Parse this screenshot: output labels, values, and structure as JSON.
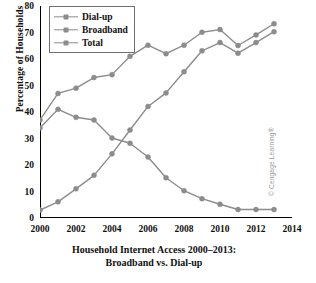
{
  "chart_data": {
    "type": "line",
    "title": "Household Internet Access 2000–2013:\nBroadband vs. Dial-up",
    "title_line1": "Household Internet Access 2000–2013:",
    "title_line2": "Broadband vs. Dial-up",
    "xlabel": "",
    "ylabel": "Percentage of Households",
    "x": [
      2000,
      2001,
      2002,
      2003,
      2004,
      2005,
      2006,
      2007,
      2008,
      2009,
      2010,
      2011,
      2012,
      2013
    ],
    "categories": [
      "2000",
      "2001",
      "2002",
      "2003",
      "2004",
      "2005",
      "2006",
      "2007",
      "2008",
      "2009",
      "2010",
      "2011",
      "2012",
      "2013"
    ],
    "xlim": [
      2000,
      2014
    ],
    "ylim": [
      0,
      80
    ],
    "xticks": [
      2000,
      2002,
      2004,
      2006,
      2008,
      2010,
      2012,
      2014
    ],
    "xtick_labels": [
      "2000",
      "2002",
      "2004",
      "2006",
      "2008",
      "2010",
      "2012",
      "2014"
    ],
    "yticks": [
      0,
      10,
      20,
      30,
      40,
      50,
      60,
      70,
      80
    ],
    "ytick_labels": [
      "0",
      "10",
      "20",
      "30",
      "40",
      "50",
      "60",
      "70",
      "80"
    ],
    "grid": false,
    "legend_position": "upper left",
    "marker": "circle",
    "series": [
      {
        "name": "Dial-up",
        "color": "#8c8c8c",
        "values": [
          34.0,
          41.0,
          38.0,
          37.0,
          30.2,
          28.2,
          23.0,
          15.2,
          10.3,
          7.3,
          5.2,
          3.2,
          3.2,
          3.2
        ]
      },
      {
        "name": "Broadband",
        "color": "#8c8c8c",
        "values": [
          3.0,
          6.1,
          11.0,
          16.1,
          24.2,
          33.2,
          42.1,
          47.2,
          55.2,
          63.1,
          66.2,
          62.2,
          66.2,
          70.3
        ]
      },
      {
        "name": "Total",
        "color": "#8c8c8c",
        "values": [
          37.0,
          47.0,
          49.0,
          53.0,
          54.1,
          61.0,
          65.2,
          62.0,
          65.2,
          70.1,
          71.1,
          65.1,
          69.1,
          73.3
        ]
      }
    ]
  },
  "legend": {
    "items": [
      {
        "label": "Dial-up"
      },
      {
        "label": "Broadband"
      },
      {
        "label": "Total"
      }
    ]
  },
  "credit": {
    "text": "© Cengage Learning®"
  }
}
